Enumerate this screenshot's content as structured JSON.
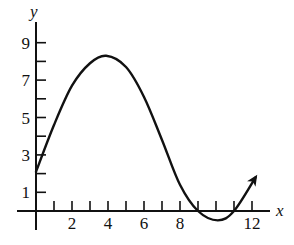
{
  "chart_data": {
    "type": "line",
    "title": "",
    "xlabel": "x",
    "ylabel": "y",
    "xlim": [
      0,
      13
    ],
    "ylim": [
      -1,
      10
    ],
    "grid": false,
    "legend": null,
    "x_ticks": [
      1,
      2,
      3,
      4,
      5,
      6,
      7,
      8,
      9,
      10,
      11,
      12
    ],
    "x_tick_labels": [
      "2",
      "4",
      "6",
      "8",
      "12"
    ],
    "x_tick_label_values": [
      2,
      4,
      6,
      8,
      12
    ],
    "y_ticks": [
      1,
      2,
      3,
      4,
      5,
      6,
      7,
      8,
      9
    ],
    "y_tick_labels": [
      "1",
      "3",
      "5",
      "7",
      "9"
    ],
    "y_tick_label_values": [
      1,
      3,
      5,
      7,
      9
    ],
    "series": [
      {
        "name": "curve",
        "x": [
          0,
          1,
          2,
          3,
          3.9,
          5,
          6,
          7,
          8,
          9,
          10.1,
          11,
          12.2
        ],
        "values": [
          2.1,
          4.6,
          6.7,
          7.9,
          8.3,
          7.7,
          6.1,
          3.8,
          1.4,
          0.0,
          -0.5,
          0.0,
          1.8
        ],
        "ends_with_arrow": true
      }
    ],
    "annotations": {
      "max_point": [
        3.9,
        8.3
      ],
      "min_point": [
        10.1,
        -0.5
      ],
      "y_intercept": 2.1,
      "x_intercepts": [
        9,
        11
      ]
    }
  },
  "axes": {
    "x_label": "x",
    "y_label": "y"
  }
}
